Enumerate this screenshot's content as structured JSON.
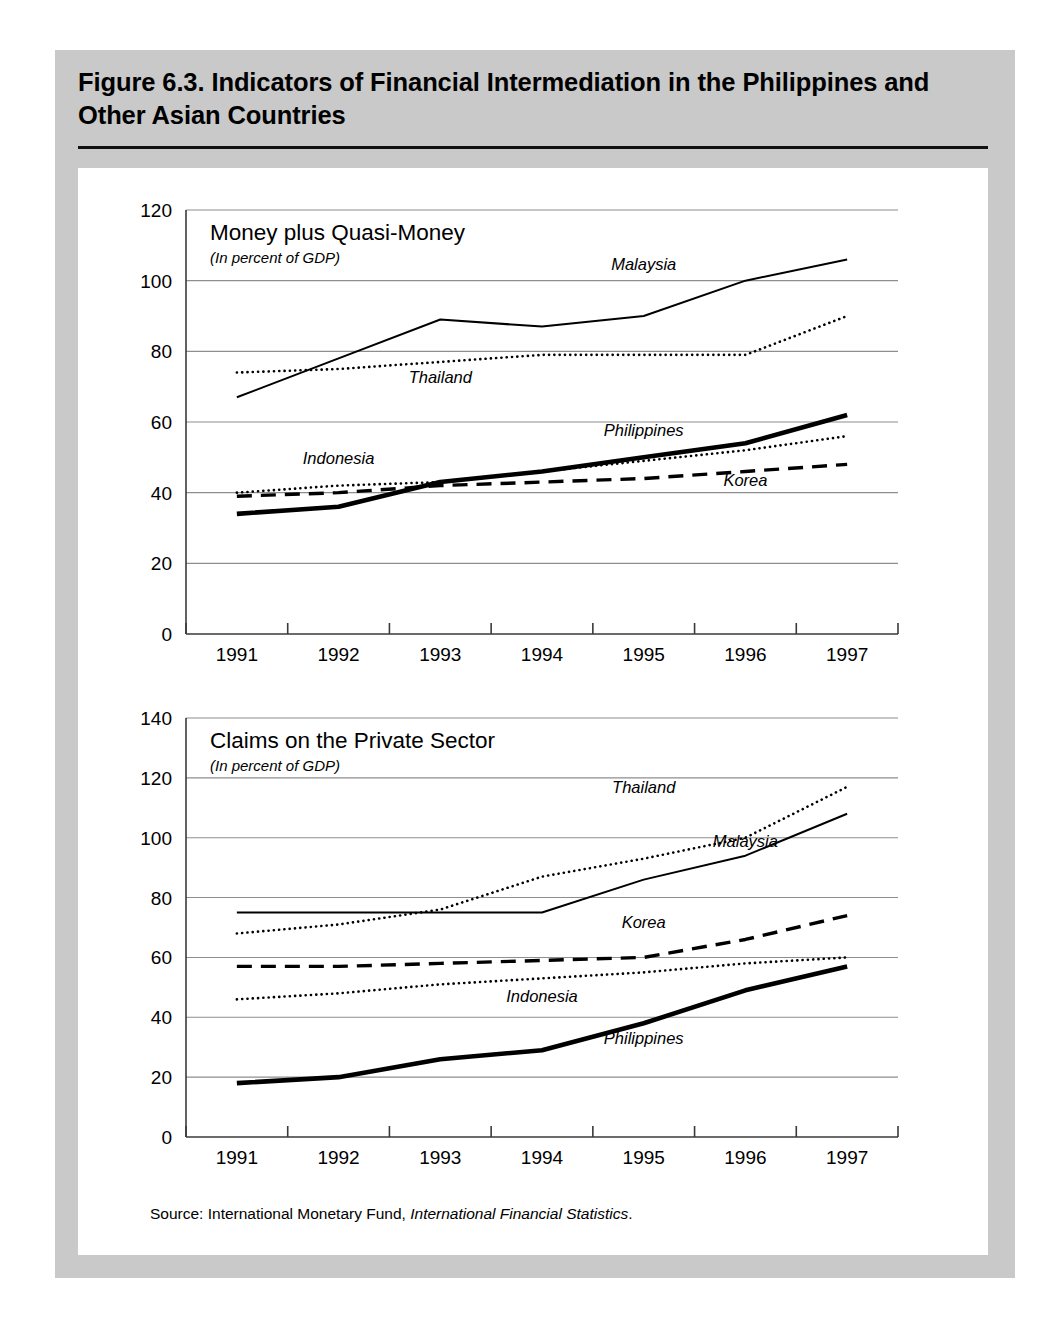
{
  "figure": {
    "title": "Figure 6.3.  Indicators of Financial Intermediation in the Philippines and Other Asian Countries",
    "source_prefix": "Source:  International Monetary Fund,",
    "source_italic": "International Financial Statistics",
    "source_suffix": "."
  },
  "colors": {
    "panel_background": "#c9c9c9",
    "sheet_background": "#ffffff",
    "ink": "#000000",
    "gridline": "#8e8e8e",
    "axis": "#3a3a3a"
  },
  "chart_data": [
    {
      "id": "money-plus-quasi-money",
      "type": "line",
      "title": "Money plus Quasi-Money",
      "subtitle": "(In percent of GDP)",
      "xlabel": "",
      "ylabel": "",
      "grid": true,
      "legend_position": "inline-labels",
      "x": [
        "1991",
        "1992",
        "1993",
        "1994",
        "1995",
        "1996",
        "1997"
      ],
      "xticklabels": [
        "1991",
        "1992",
        "1993",
        "1994",
        "1995",
        "1996",
        "1997"
      ],
      "ylim": [
        0,
        120
      ],
      "yticks": [
        0,
        20,
        40,
        60,
        80,
        100,
        120
      ],
      "yticklabels": [
        "0",
        "20",
        "40",
        "60",
        "80",
        "100",
        "120"
      ],
      "series": [
        {
          "name": "Malaysia",
          "style": "solid-thin",
          "stroke_width": 2.0,
          "dasharray": "",
          "label_x": "1995",
          "label_value": 103,
          "values": [
            67,
            78,
            89,
            87,
            90,
            100,
            106
          ]
        },
        {
          "name": "Thailand",
          "style": "dotted",
          "stroke_width": 2.6,
          "dasharray": "0.1,5.2",
          "label_x": "1993",
          "label_value": 71,
          "values": [
            74,
            75,
            77,
            79,
            79,
            79,
            90
          ]
        },
        {
          "name": "Philippines",
          "style": "solid-thick",
          "stroke_width": 4.6,
          "dasharray": "",
          "label_x": "1995",
          "label_value": 56,
          "values": [
            34,
            36,
            43,
            46,
            50,
            54,
            62
          ]
        },
        {
          "name": "Indonesia",
          "style": "dotted",
          "stroke_width": 2.6,
          "dasharray": "0.1,5.2",
          "label_x": "1992",
          "label_value": 48,
          "values": [
            40,
            42,
            43,
            46,
            49,
            52,
            56
          ]
        },
        {
          "name": "Korea",
          "style": "dashed",
          "stroke_width": 3.4,
          "dasharray": "15,9",
          "label_x": "1996",
          "label_value": 42,
          "values": [
            39,
            40,
            42,
            43,
            44,
            46,
            48
          ]
        }
      ]
    },
    {
      "id": "claims-on-the-private-sector",
      "type": "line",
      "title": "Claims on the Private Sector",
      "subtitle": "(In percent of GDP)",
      "xlabel": "",
      "ylabel": "",
      "grid": true,
      "legend_position": "inline-labels",
      "x": [
        "1991",
        "1992",
        "1993",
        "1994",
        "1995",
        "1996",
        "1997"
      ],
      "xticklabels": [
        "1991",
        "1992",
        "1993",
        "1994",
        "1995",
        "1996",
        "1997"
      ],
      "ylim": [
        0,
        140
      ],
      "yticks": [
        0,
        20,
        40,
        60,
        80,
        100,
        120,
        140
      ],
      "yticklabels": [
        "0",
        "20",
        "40",
        "60",
        "80",
        "100",
        "120",
        "140"
      ],
      "series": [
        {
          "name": "Thailand",
          "style": "dotted",
          "stroke_width": 2.6,
          "dasharray": "0.1,5.2",
          "label_x": "1995",
          "label_value": 115,
          "values": [
            68,
            71,
            76,
            87,
            93,
            100,
            117
          ]
        },
        {
          "name": "Malaysia",
          "style": "solid-thin",
          "stroke_width": 2.0,
          "dasharray": "",
          "label_x": "1996",
          "label_value": 97,
          "values": [
            75,
            75,
            75,
            75,
            86,
            94,
            108
          ]
        },
        {
          "name": "Korea",
          "style": "dashed",
          "stroke_width": 3.4,
          "dasharray": "15,9",
          "label_x": "1995",
          "label_value": 70,
          "values": [
            57,
            57,
            58,
            59,
            60,
            66,
            74
          ]
        },
        {
          "name": "Indonesia",
          "style": "dotted",
          "stroke_width": 2.6,
          "dasharray": "0.1,5.2",
          "label_x": "1994",
          "label_value": 45,
          "values": [
            46,
            48,
            51,
            53,
            55,
            58,
            60
          ]
        },
        {
          "name": "Philippines",
          "style": "solid-thick",
          "stroke_width": 4.6,
          "dasharray": "",
          "label_x": "1995",
          "label_value": 31,
          "values": [
            18,
            20,
            26,
            29,
            38,
            49,
            57
          ]
        }
      ]
    }
  ]
}
